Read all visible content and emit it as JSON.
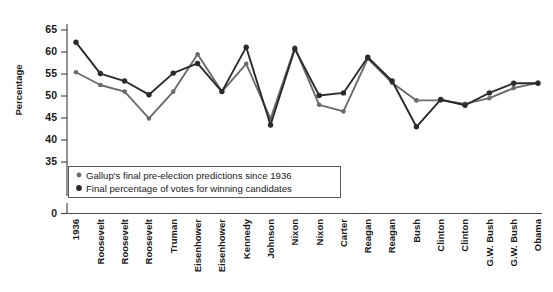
{
  "chart_data": {
    "type": "line",
    "title": "",
    "xlabel": "",
    "ylabel": "Percentage",
    "ylim": [
      33,
      67
    ],
    "yticks": [
      35,
      40,
      45,
      50,
      55,
      60,
      65
    ],
    "axis_origin_label": "0",
    "grid": false,
    "legend_position": "inside-bottom-left",
    "categories": [
      "1936",
      "Roosevelt",
      "Roosevelt",
      "Roosevelt",
      "Truman",
      "Eisenhower",
      "Eisenhower",
      "Kennedy",
      "Johnson",
      "Nixon",
      "Nixon",
      "Carter",
      "Reagan",
      "Reagan",
      "Bush",
      "Clinton",
      "Clinton",
      "G.W. Bush",
      "G.W. Bush",
      "Obama"
    ],
    "series": [
      {
        "name": "Gallup's final pre-election predictions since 1936",
        "color": "#6b6b6b",
        "marker": "circle",
        "values": [
          55.4,
          52.5,
          51.0,
          44.9,
          51.0,
          59.5,
          51.0,
          44.8,
          61.0,
          48.0,
          46.5,
          58.5,
          53.0,
          49.0,
          49.0,
          48.2,
          49.5,
          51.8,
          53.0,
          null
        ]
      },
      {
        "name": "Final percentage of votes for winning candidates",
        "color": "#2b2b2b",
        "marker": "circle",
        "values": [
          62.2,
          55.1,
          53.4,
          50.3,
          55.2,
          57.4,
          51.0,
          61.1,
          43.4,
          60.7,
          50.1,
          50.7,
          58.8,
          53.4,
          43.0,
          49.2,
          47.9,
          50.7,
          52.9,
          null
        ]
      }
    ],
    "series_points_gray": [
      {
        "x": "Roosevelt",
        "y": 55.4
      },
      {
        "x": "Roosevelt",
        "y": 52.5
      },
      {
        "x": "Roosevelt",
        "y": 51.0
      },
      {
        "x": "Truman",
        "y": 44.9
      },
      {
        "x": "Eisenhower",
        "y": 51.0
      },
      {
        "x": "Eisenhower",
        "y": 59.5
      },
      {
        "x": "Kennedy",
        "y": 51.0
      },
      {
        "x": "Johnson",
        "y": 57.3
      },
      {
        "x": "Nixon",
        "y": 44.8
      },
      {
        "x": "Nixon",
        "y": 61.0
      },
      {
        "x": "Carter",
        "y": 48.0
      },
      {
        "x": "Reagan",
        "y": 46.5
      },
      {
        "x": "Reagan",
        "y": 58.5
      },
      {
        "x": "Bush",
        "y": 53.0
      },
      {
        "x": "Clinton",
        "y": 49.0
      },
      {
        "x": "Clinton",
        "y": 49.0
      },
      {
        "x": "G.W. Bush",
        "y": 48.2
      },
      {
        "x": "G.W. Bush",
        "y": 49.5
      },
      {
        "x": "Obama",
        "y": 51.8
      },
      {
        "x": "Obama",
        "y": 53.0
      }
    ],
    "series_points_dark": [
      {
        "x": "Roosevelt",
        "y": 62.2
      },
      {
        "x": "Roosevelt",
        "y": 55.1
      },
      {
        "x": "Roosevelt",
        "y": 53.4
      },
      {
        "x": "Truman",
        "y": 50.3
      },
      {
        "x": "Eisenhower",
        "y": 55.2
      },
      {
        "x": "Eisenhower",
        "y": 57.4
      },
      {
        "x": "Kennedy",
        "y": 51.0
      },
      {
        "x": "Johnson",
        "y": 61.1
      },
      {
        "x": "Nixon",
        "y": 43.4
      },
      {
        "x": "Nixon",
        "y": 60.7
      },
      {
        "x": "Carter",
        "y": 50.1
      },
      {
        "x": "Reagan",
        "y": 50.7
      },
      {
        "x": "Reagan",
        "y": 58.8
      },
      {
        "x": "Bush",
        "y": 53.4
      },
      {
        "x": "Clinton",
        "y": 43.0
      },
      {
        "x": "Clinton",
        "y": 49.2
      },
      {
        "x": "Clinton",
        "y": 47.9
      },
      {
        "x": "G.W. Bush",
        "y": 50.7
      },
      {
        "x": "G.W. Bush",
        "y": 52.9
      },
      {
        "x": "Obama",
        "y": 52.9
      }
    ],
    "legend": [
      {
        "label": "Gallup's final pre-election predictions since 1936",
        "color": "#6b6b6b"
      },
      {
        "label": "Final percentage of votes for winning candidates",
        "color": "#2b2b2b"
      }
    ]
  },
  "axis": {
    "y_title": "Percentage",
    "zero_label": "0"
  }
}
